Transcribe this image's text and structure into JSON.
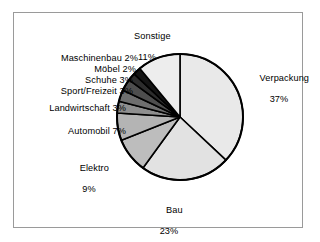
{
  "figure": {
    "background": "#ffffff",
    "frame_border_color": "#9a9a9a"
  },
  "chart_data": {
    "type": "pie",
    "title": "",
    "start_angle_deg": 0,
    "direction": "clockwise",
    "total_pct": 100,
    "units": "percent",
    "categories": [
      "Verpackung",
      "Bau",
      "Elektro",
      "Automobil",
      "Landwirtschaft",
      "Sport/Freizeit",
      "Schuhe",
      "Möbel",
      "Maschinenbau",
      "Sonstige"
    ],
    "values": [
      37,
      23,
      9,
      7,
      3,
      3,
      3,
      2,
      2,
      11
    ],
    "slice_colors": [
      "#e9e9e9",
      "#e2e2e2",
      "#bdbdbd",
      "#b4b4b4",
      "#8f8f8f",
      "#6e6e6e",
      "#4e4e4e",
      "#2d2d2d",
      "#141414",
      "#ededed"
    ],
    "legend": "none",
    "data_labels": "outside-with-percent"
  },
  "labels": {
    "sonstige": {
      "name": "Sonstige",
      "pct": "11%"
    },
    "verpackung": {
      "name": "Verpackung",
      "pct": "37%"
    },
    "bau": {
      "name": "Bau",
      "pct": "23%"
    },
    "elektro": {
      "name": "Elektro",
      "pct": "9%"
    },
    "automobil": {
      "text": "Automobil 7%"
    },
    "landwirtschaft": {
      "text": "Landwirtschaft 3%"
    },
    "sport_freizeit": {
      "text": "Sport/Freizeit 3%"
    },
    "schuhe": {
      "text": "Schuhe 3%"
    },
    "moebel": {
      "text": "Möbel 2%"
    },
    "maschinenbau": {
      "text": "Maschinenbau 2%"
    }
  }
}
